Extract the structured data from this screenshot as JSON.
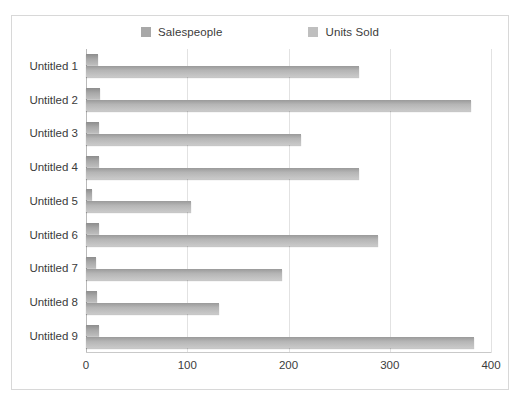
{
  "chart_data": {
    "type": "bar",
    "orientation": "horizontal",
    "title": "",
    "xlabel": "",
    "ylabel": "",
    "categories": [
      "Untitled 1",
      "Untitled 2",
      "Untitled 3",
      "Untitled 4",
      "Untitled 5",
      "Untitled 6",
      "Untitled 7",
      "Untitled 8",
      "Untitled 9"
    ],
    "series": [
      {
        "name": "Salespeople",
        "color": "#a8a8a8",
        "values": [
          12,
          14,
          13,
          13,
          6,
          13,
          10,
          11,
          13
        ]
      },
      {
        "name": "Units Sold",
        "color": "#b5b5b5",
        "values": [
          270,
          380,
          212,
          270,
          104,
          288,
          194,
          131,
          383
        ]
      }
    ],
    "xlim": [
      0,
      400
    ],
    "xticks": [
      0,
      100,
      200,
      300,
      400
    ],
    "xtick_labels": [
      "0",
      "100",
      "200",
      "300",
      "400"
    ],
    "grid": true,
    "legend_position": "top"
  },
  "legend": {
    "entries": [
      {
        "label": "Salespeople",
        "color": "#a8a8a8"
      },
      {
        "label": "Units Sold",
        "color": "#bfbfbf"
      }
    ]
  },
  "frame": {
    "border_color": "#d8d8d8",
    "background": "#ffffff"
  }
}
